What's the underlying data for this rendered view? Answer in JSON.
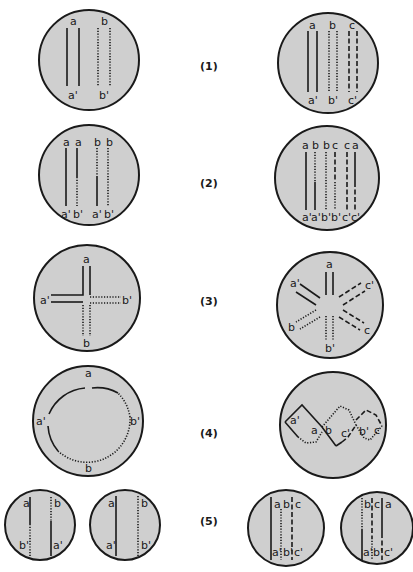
{
  "figure": {
    "colors": {
      "cell_fill": "#cfcfcf",
      "ink": "#1a1a1a",
      "background": "#ffffff"
    },
    "line_styles": {
      "chromosome_a": "solid",
      "chromosome_b": "dotted",
      "chromosome_c": "dashed"
    },
    "rows": [
      {
        "label": "(1)",
        "left": {
          "chromosomes": [
            "a",
            "b"
          ],
          "top_labels": [
            "a",
            "b"
          ],
          "bottom_labels": [
            "a'",
            "b'"
          ]
        },
        "right": {
          "chromosomes": [
            "a",
            "b",
            "c"
          ],
          "top_labels": [
            "a",
            "b",
            "c"
          ],
          "bottom_labels": [
            "a'",
            "b'",
            "c'"
          ]
        }
      },
      {
        "label": "(2)",
        "left": {
          "top_labels": [
            "a",
            "a",
            "b",
            "b"
          ],
          "bottom_labels": [
            "a'",
            "b'",
            "a'",
            "b'"
          ]
        },
        "right": {
          "top_labels": [
            "a",
            "b",
            "b",
            "c",
            "c",
            "a"
          ],
          "bottom_labels": [
            "a'",
            "a'",
            "b'",
            "b'",
            "c'",
            "c'"
          ]
        }
      },
      {
        "label": "(3)",
        "left": {
          "arm_labels": [
            "a",
            "b'",
            "b",
            "a'"
          ]
        },
        "right": {
          "arm_labels": [
            "a",
            "c'",
            "c",
            "b'",
            "b",
            "a'"
          ]
        }
      },
      {
        "label": "(4)",
        "left": {
          "ring_labels": [
            "a",
            "b'",
            "b",
            "a'"
          ]
        },
        "right": {
          "chain_labels": [
            "a'",
            "a",
            "b",
            "c'",
            "b'",
            "c"
          ]
        }
      },
      {
        "label": "(5)",
        "cells": [
          {
            "top_labels": [
              "a",
              "b"
            ],
            "bottom_labels": [
              "b'",
              "a'"
            ]
          },
          {
            "top_labels": [
              "a",
              "b"
            ],
            "bottom_labels": [
              "a'",
              "b'"
            ]
          },
          {
            "top_labels": [
              "a",
              "b",
              "c"
            ],
            "bottom_labels": [
              "a'",
              "b'",
              "c'"
            ]
          },
          {
            "top_labels": [
              "b",
              "c",
              "a"
            ],
            "bottom_labels": [
              "a'",
              "b'",
              "c'"
            ]
          }
        ]
      }
    ]
  }
}
